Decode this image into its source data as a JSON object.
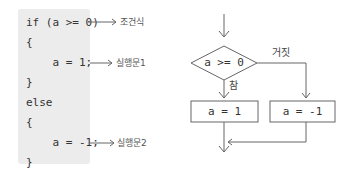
{
  "code": {
    "lines": [
      "if (a >= 0)",
      "{",
      "    a = 1;",
      "}",
      "else",
      "{",
      "    a = -1;",
      "}"
    ]
  },
  "annotations": {
    "condition": "조건식",
    "statement1": "실행문1",
    "statement2": "실행문2"
  },
  "flowchart": {
    "decision": "a >= 0",
    "true_label": "참",
    "false_label": "거짓",
    "true_box": "a = 1",
    "false_box": "a = -1"
  },
  "colors": {
    "code_bg": "#ececec",
    "line": "#666666",
    "text": "#333333"
  }
}
